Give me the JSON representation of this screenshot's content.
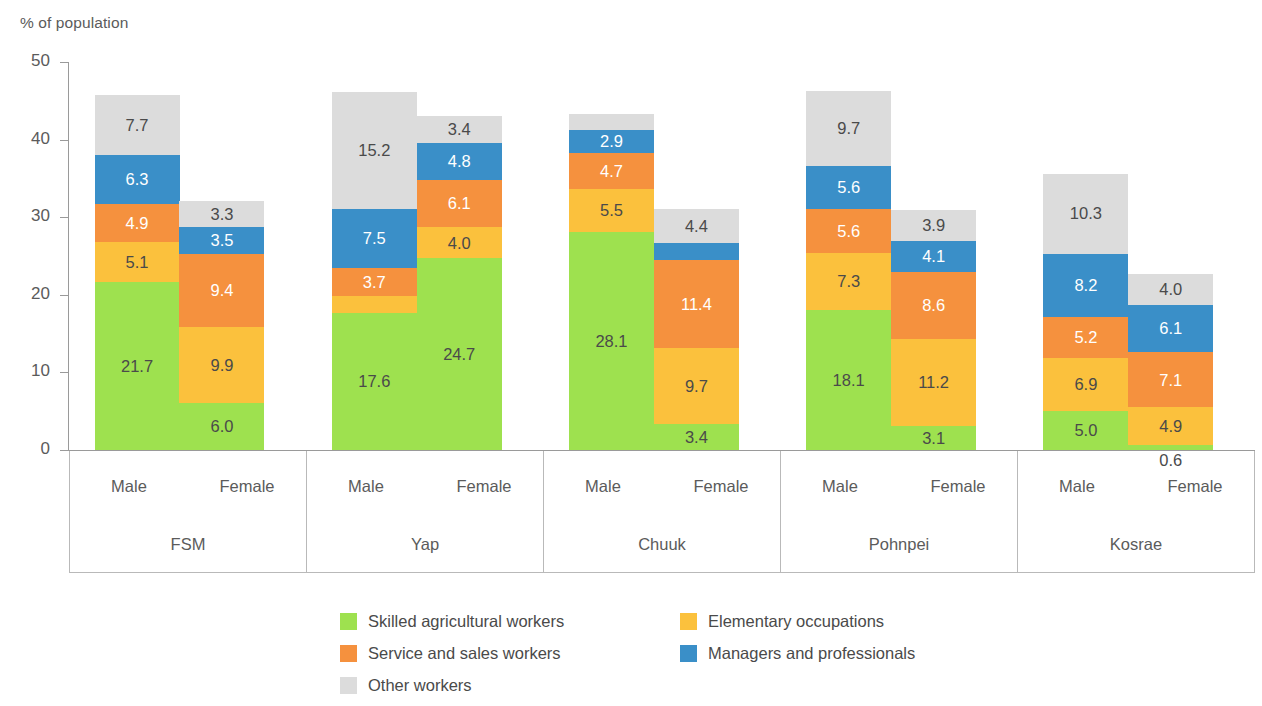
{
  "chart_data": {
    "type": "bar",
    "subtype": "stacked-bar-grouped",
    "title": "",
    "ylabel": "% of population",
    "xlabel": "",
    "ylim": [
      0,
      50
    ],
    "yticks": [
      "0",
      "10",
      "20",
      "30",
      "40",
      "50"
    ],
    "grid": false,
    "legend_position": "bottom",
    "group_labels": [
      "FSM",
      "Yap",
      "Chuuk",
      "Pohnpei",
      "Kosrae"
    ],
    "subgroup_labels": [
      "Male",
      "Female"
    ],
    "categories": [
      "FSM Male",
      "FSM Female",
      "Yap Male",
      "Yap Female",
      "Chuuk Male",
      "Chuuk Female",
      "Pohnpei Male",
      "Pohnpei Female",
      "Kosrae Male",
      "Kosrae Female"
    ],
    "series": [
      {
        "name": "Skilled agricultural workers",
        "color": "#9ee14f",
        "label_color": "dark",
        "values": [
          21.7,
          6.0,
          17.6,
          24.7,
          28.1,
          3.4,
          18.1,
          3.1,
          5.0,
          0.6
        ]
      },
      {
        "name": "Elementary occupations",
        "color": "#fbc13d",
        "label_color": "dark",
        "values": [
          5.1,
          9.9,
          2.2,
          4.0,
          5.5,
          9.7,
          7.3,
          11.2,
          6.9,
          4.9
        ]
      },
      {
        "name": "Service and sales workers",
        "color": "#f5913e",
        "label_color": "light",
        "values": [
          4.9,
          9.4,
          3.7,
          6.1,
          4.7,
          11.4,
          5.6,
          8.6,
          5.2,
          7.1
        ]
      },
      {
        "name": "Managers and professionals",
        "color": "#3a8fc8",
        "label_color": "light",
        "values": [
          6.3,
          3.5,
          7.5,
          4.8,
          2.9,
          2.2,
          5.6,
          4.1,
          8.2,
          6.1
        ]
      },
      {
        "name": "Other workers",
        "color": "#dcdcdc",
        "label_color": "dark",
        "values": [
          7.7,
          3.3,
          15.2,
          3.4,
          2.1,
          4.4,
          9.7,
          3.9,
          10.3,
          4.0
        ]
      }
    ],
    "totals": [
      45.7,
      32.1,
      46.2,
      43.0,
      43.3,
      31.1,
      46.3,
      30.9,
      35.6,
      22.7
    ]
  },
  "legend": {
    "items": [
      {
        "label": "Skilled agricultural workers",
        "color": "#9ee14f"
      },
      {
        "label": "Elementary occupations",
        "color": "#fbc13d"
      },
      {
        "label": "Service and sales workers",
        "color": "#f5913e"
      },
      {
        "label": "Managers and professionals",
        "color": "#3a8fc8"
      },
      {
        "label": "Other workers",
        "color": "#dcdcdc"
      }
    ]
  },
  "axis": {
    "title": "% of population",
    "tick_color": "#9a9a9a",
    "text_color": "#5b5b5b"
  }
}
